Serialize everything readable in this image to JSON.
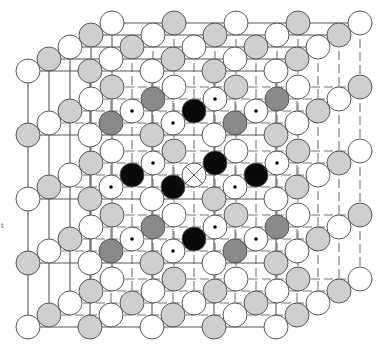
{
  "diagram": {
    "type": "crystal-lattice",
    "side_label": "t",
    "grid_size": 5,
    "projection": {
      "origin": [
        28,
        327
      ],
      "x_step": [
        62,
        0
      ],
      "y_step": [
        0,
        -64
      ],
      "z_step": [
        21,
        -12
      ],
      "atom_radius": 12
    },
    "colors": {
      "line": "#555555",
      "hidden_line": "#777777",
      "white_atom": "#ffffff",
      "light_atom": "#cfcfcf",
      "dark_atom": "#8a8a8a",
      "black_atom": "#0a0a0a",
      "outline": "#555555"
    },
    "legend_types": {
      "white": "host atom A",
      "light": "host atom B",
      "dark": "inner-cluster corner atom",
      "dotted": "inner-cluster edge atom",
      "black": "nearest-neighbour atom",
      "crossed": "central defect site"
    },
    "center": [
      2,
      2,
      2
    ]
  }
}
